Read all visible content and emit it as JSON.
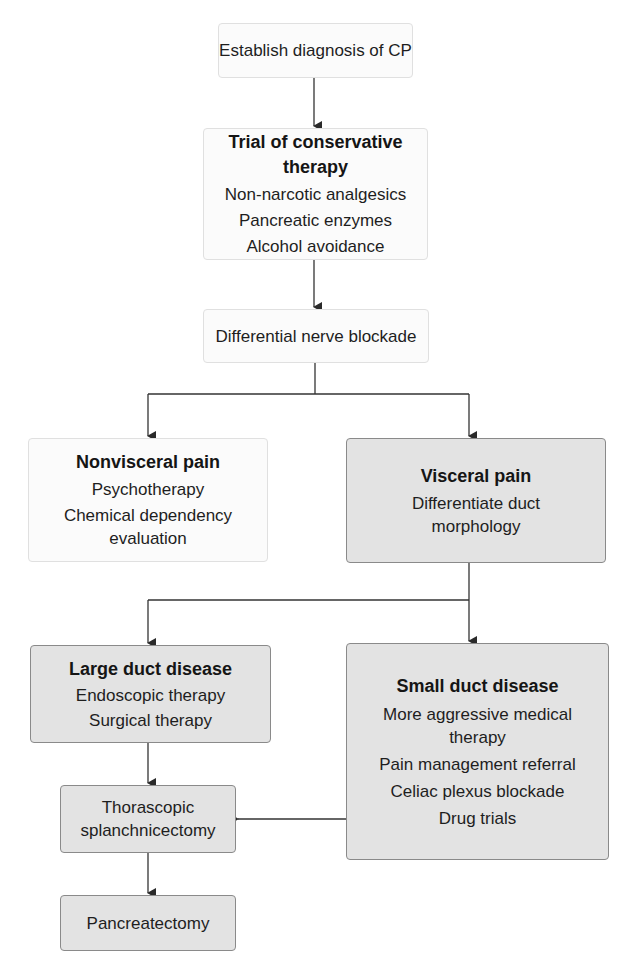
{
  "diagram": {
    "type": "flowchart",
    "nodes": {
      "establish": {
        "lines": [
          "Establish diagnosis of CP"
        ]
      },
      "conservative": {
        "title": "Trial of conservative therapy",
        "lines": [
          "Non-narcotic analgesics",
          "Pancreatic enzymes",
          "Alcohol avoidance"
        ]
      },
      "blockade": {
        "lines": [
          "Differential nerve blockade"
        ]
      },
      "nonvisceral": {
        "title": "Nonvisceral pain",
        "lines": [
          "Psychotherapy",
          "Chemical dependency",
          "evaluation"
        ]
      },
      "visceral": {
        "title": "Visceral pain",
        "lines": [
          "Differentiate duct",
          "morphology"
        ]
      },
      "large_duct": {
        "title": "Large duct disease",
        "lines": [
          "Endoscopic therapy",
          "Surgical therapy"
        ]
      },
      "small_duct": {
        "title": "Small duct disease",
        "lines": [
          "More aggressive medical",
          "therapy",
          "Pain management referral",
          "Celiac plexus blockade",
          "Drug trials"
        ]
      },
      "splanchnicectomy": {
        "lines": [
          "Thorascopic",
          "splanchnicectomy"
        ]
      },
      "pancreatectomy": {
        "lines": [
          "Pancreatectomy"
        ]
      }
    },
    "edges": [
      [
        "establish",
        "conservative"
      ],
      [
        "conservative",
        "blockade"
      ],
      [
        "blockade",
        "nonvisceral"
      ],
      [
        "blockade",
        "visceral"
      ],
      [
        "visceral",
        "large_duct"
      ],
      [
        "visceral",
        "small_duct"
      ],
      [
        "large_duct",
        "splanchnicectomy"
      ],
      [
        "small_duct",
        "splanchnicectomy"
      ],
      [
        "splanchnicectomy",
        "pancreatectomy"
      ]
    ],
    "colors": {
      "light_fill": "#fbfbfb",
      "gray_fill": "#e3e3e3",
      "gray_border": "#8a8a8a",
      "line": "#333333"
    }
  }
}
